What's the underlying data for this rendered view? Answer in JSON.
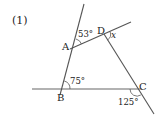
{
  "problem": {
    "number_label": "(1)"
  },
  "diagram": {
    "line_color": "#555555",
    "text_color": "#222222",
    "points": {
      "A": {
        "label": "A",
        "x": 74,
        "y": 47
      },
      "B": {
        "label": "B",
        "x": 62,
        "y": 89
      },
      "C": {
        "label": "C",
        "x": 137,
        "y": 89
      },
      "D": {
        "label": "D",
        "x": 104,
        "y": 34
      }
    },
    "angles": [
      {
        "vertex": "A",
        "label": "53°"
      },
      {
        "vertex": "D",
        "label": "x"
      },
      {
        "vertex": "B",
        "label": "75°"
      },
      {
        "vertex": "C",
        "label": "125°"
      }
    ]
  }
}
